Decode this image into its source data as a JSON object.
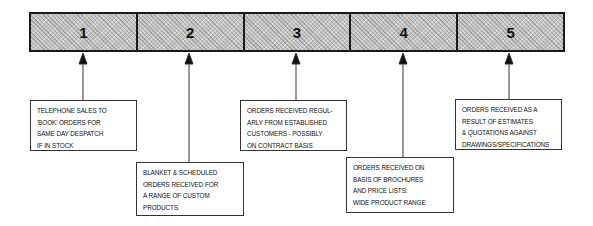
{
  "stages": [
    {
      "number": "1",
      "lines": [
        "TELEPHONE SALES TO",
        "'BOOK' ORDERS FOR",
        "SAME DAY DESPATCH",
        "IF IN STOCK"
      ]
    },
    {
      "number": "2",
      "lines": [
        "BLANKET & SCHEDULED",
        "ORDERS RECEIVED FOR",
        "A RANGE OF CUSTOM",
        "PRODUCTS"
      ]
    },
    {
      "number": "3",
      "lines": [
        "ORDERS RECEIVED REGUL-",
        "ARLY FROM ESTABLISHED",
        "CUSTOMERS - POSSIBLY",
        "ON CONTRACT BASIS"
      ]
    },
    {
      "number": "4",
      "lines": [
        "ORDERS RECEIVED ON",
        "BASIS OF BROCHURES",
        "AND PRICE LISTS:",
        "WIDE PRODUCT RANGE"
      ]
    },
    {
      "number": "5",
      "lines": [
        "ORDERS RECEIVED AS A",
        "RESULT OF ESTIMATES",
        "& QUOTATIONS AGAINST",
        "DRAWINGS/SPECIFICATIONS"
      ]
    }
  ]
}
